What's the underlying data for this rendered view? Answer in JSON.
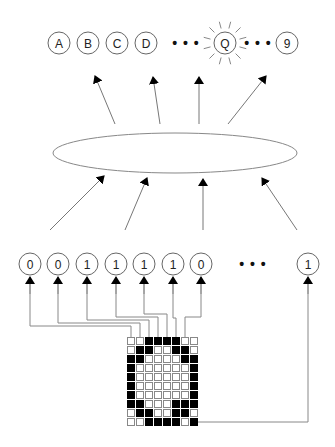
{
  "diagram": {
    "output_layer": {
      "nodes": [
        {
          "label": "A",
          "cx": 59,
          "cy": 43
        },
        {
          "label": "B",
          "cx": 88,
          "cy": 43
        },
        {
          "label": "C",
          "cx": 117,
          "cy": 43
        },
        {
          "label": "D",
          "cx": 146,
          "cy": 43
        },
        {
          "label": "Q",
          "cx": 225,
          "cy": 43,
          "highlighted": true
        },
        {
          "label": "9",
          "cx": 287,
          "cy": 43
        }
      ],
      "ellipsis": [
        {
          "text": "• • •",
          "x": 186,
          "y": 43
        },
        {
          "text": "• • •",
          "x": 258,
          "y": 43
        }
      ]
    },
    "hidden_layer": {
      "shape": "ellipse",
      "cx": 175,
      "cy": 153,
      "rx": 122,
      "ry": 20
    },
    "input_layer": {
      "nodes": [
        {
          "label": "0",
          "cx": 30,
          "cy": 264
        },
        {
          "label": "0",
          "cx": 58,
          "cy": 264
        },
        {
          "label": "1",
          "cx": 87,
          "cy": 264
        },
        {
          "label": "1",
          "cx": 116,
          "cy": 264
        },
        {
          "label": "1",
          "cx": 144,
          "cy": 264
        },
        {
          "label": "1",
          "cx": 173,
          "cy": 264
        },
        {
          "label": "0",
          "cx": 201,
          "cy": 264
        },
        {
          "label": "1",
          "cx": 308,
          "cy": 264
        }
      ],
      "ellipsis": {
        "text": "• • •",
        "x": 253,
        "y": 264
      }
    },
    "pixel_grid": {
      "rows": 10,
      "cols": 8,
      "x": 127,
      "y": 337,
      "cell": 9,
      "represents": "Q",
      "cells": [
        [
          0,
          0,
          1,
          1,
          1,
          1,
          0,
          0
        ],
        [
          0,
          1,
          1,
          0,
          0,
          1,
          1,
          0
        ],
        [
          1,
          1,
          0,
          0,
          0,
          0,
          1,
          1
        ],
        [
          1,
          0,
          0,
          0,
          0,
          0,
          0,
          1
        ],
        [
          1,
          0,
          0,
          0,
          0,
          0,
          0,
          1
        ],
        [
          1,
          0,
          0,
          0,
          0,
          0,
          0,
          1
        ],
        [
          1,
          0,
          0,
          0,
          0,
          0,
          0,
          1
        ],
        [
          1,
          1,
          0,
          0,
          0,
          1,
          1,
          1
        ],
        [
          0,
          1,
          1,
          0,
          0,
          1,
          1,
          0
        ],
        [
          0,
          0,
          1,
          1,
          1,
          1,
          0,
          1
        ]
      ]
    },
    "colors": {
      "line": "#777777",
      "arrow": "#000000",
      "node_stroke": "#666666",
      "pixel_on": "#000000",
      "pixel_off_stroke": "#888888"
    }
  }
}
